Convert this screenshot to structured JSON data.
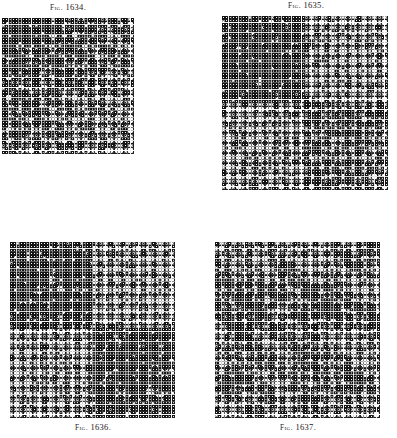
{
  "page": {
    "background_color": "#ffffff",
    "ink_color": "#111111",
    "width": 397,
    "height": 438,
    "plate_kind": "engraved-pattern-plate"
  },
  "figures": [
    {
      "id": "fig-1634",
      "caption_prefix": "Fig.",
      "caption_number": "1634.",
      "caption_full": "Fig. 1634.",
      "caption_position": "above",
      "x": 2,
      "y": 18,
      "width": 132,
      "height": 136,
      "cols": 40,
      "rows": 41,
      "cell_px": 3.3,
      "pattern": "diagonal-gradient",
      "description": "Dense square-cell weave draft shading from solid dark at the upper left to open light at the lower right along an anti-diagonal, with diagonal banding.",
      "dark_color": "#141414",
      "light_color": "#ffffff",
      "seed": 1634,
      "gradient_axis": "anti-diagonal",
      "dark_fraction_start": 0.92,
      "dark_fraction_end": 0.18,
      "band_period": 5,
      "band_strength": 0.3
    },
    {
      "id": "fig-1635",
      "caption_prefix": "Fig.",
      "caption_number": "1635.",
      "caption_full": "Fig. 1635.",
      "caption_position": "above",
      "x": 222,
      "y": 16,
      "width": 166,
      "height": 174,
      "cols": 50,
      "rows": 52,
      "cell_px": 3.32,
      "pattern": "quadrant-block",
      "description": "Square weave draft divided into four blocks: dense dark upper left, open light upper right, open light lower left, mottled mixed lower right.",
      "dark_color": "#141414",
      "light_color": "#ffffff",
      "seed": 1635,
      "quadrants": [
        {
          "name": "top-left",
          "dark_fraction": 0.88
        },
        {
          "name": "top-right",
          "dark_fraction": 0.2
        },
        {
          "name": "bottom-left",
          "dark_fraction": 0.22
        },
        {
          "name": "bottom-right",
          "dark_fraction": 0.55
        }
      ],
      "band_period": 4,
      "band_strength": 0.18
    },
    {
      "id": "fig-1636",
      "caption_prefix": "Fig.",
      "caption_number": "1636.",
      "caption_full": "Fig. 1636.",
      "caption_position": "below",
      "x": 10,
      "y": 242,
      "width": 165,
      "height": 176,
      "cols": 50,
      "rows": 53,
      "cell_px": 3.3,
      "pattern": "quadrant-checker",
      "description": "Square weave draft in four checkered blocks: dark upper left, light upper right, light lower left, dark lower right.",
      "dark_color": "#141414",
      "light_color": "#ffffff",
      "seed": 1636,
      "quadrants": [
        {
          "name": "top-left",
          "dark_fraction": 0.86
        },
        {
          "name": "top-right",
          "dark_fraction": 0.18
        },
        {
          "name": "bottom-left",
          "dark_fraction": 0.18
        },
        {
          "name": "bottom-right",
          "dark_fraction": 0.86
        }
      ],
      "band_period": 4,
      "band_strength": 0.16
    },
    {
      "id": "fig-1637",
      "caption_prefix": "Fig.",
      "caption_number": "1637.",
      "caption_full": "Fig. 1637.",
      "caption_position": "below",
      "x": 215,
      "y": 242,
      "width": 165,
      "height": 176,
      "cols": 50,
      "rows": 53,
      "cell_px": 3.3,
      "pattern": "mottled-diagonal",
      "description": "Square weave draft with an evenly mottled mid-tone field broken by drifting diagonal bands of darker and lighter cells.",
      "dark_color": "#141414",
      "light_color": "#ffffff",
      "seed": 1637,
      "base_dark_fraction": 0.46,
      "band_period": 11,
      "band_strength": 0.42,
      "patch_scale": 7
    }
  ]
}
